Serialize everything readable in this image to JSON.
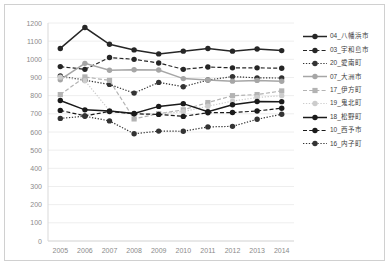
{
  "chart_data": {
    "type": "line",
    "title": "",
    "xlabel": "",
    "ylabel": "",
    "x": [
      2005,
      2006,
      2007,
      2008,
      2009,
      2010,
      2011,
      2012,
      2013,
      2014
    ],
    "xtick_labels": [
      "2005",
      "2006",
      "2007",
      "2008",
      "2009",
      "2010",
      "2011",
      "2012",
      "2013",
      "2014"
    ],
    "ytick_labels": [
      "1200",
      "1100",
      "1000",
      "900",
      "800",
      "700",
      "600",
      "500",
      "400",
      "300",
      "200",
      "100",
      "0"
    ],
    "ylim": [
      0,
      1200
    ],
    "ytick_step": 100,
    "grid": true,
    "legend_position": "right",
    "series": [
      {
        "name": "04_八幡浜市",
        "color": "#262626",
        "dash": "solid",
        "marker": "circle",
        "values": [
          1060,
          1175,
          1083,
          1052,
          1030,
          1045,
          1060,
          1045,
          1057,
          1048
        ]
      },
      {
        "name": "03_宇和島市",
        "color": "#262626",
        "dash": "dashed",
        "marker": "circle",
        "values": [
          960,
          945,
          1010,
          1000,
          980,
          945,
          958,
          953,
          953,
          951
        ]
      },
      {
        "name": "20_愛南町",
        "color": "#333333",
        "dash": "dotted",
        "marker": "circle",
        "values": [
          908,
          885,
          862,
          814,
          873,
          849,
          886,
          905,
          898,
          897
        ]
      },
      {
        "name": "07_大洲市",
        "color": "#a6a6a6",
        "dash": "solid",
        "marker": "circle",
        "values": [
          888,
          978,
          940,
          943,
          941,
          894,
          886,
          880,
          884,
          879
        ]
      },
      {
        "name": "17_伊方町",
        "color": "#b3b3b3",
        "dash": "dashed",
        "marker": "square",
        "values": [
          806,
          903,
          884,
          672,
          701,
          722,
          762,
          800,
          806,
          826
        ]
      },
      {
        "name": "19_鬼北町",
        "color": "#cccccc",
        "dash": "dotted",
        "marker": "circle",
        "values": [
          902,
          882,
          718,
          700,
          700,
          712,
          742,
          770,
          790,
          800
        ]
      },
      {
        "name": "18_松野町",
        "color": "#1a1a1a",
        "dash": "solid",
        "marker": "circle",
        "values": [
          773,
          722,
          715,
          702,
          741,
          756,
          712,
          750,
          768,
          767
        ]
      },
      {
        "name": "10_西予市",
        "color": "#1a1a1a",
        "dash": "dashed",
        "marker": "circle",
        "values": [
          719,
          689,
          713,
          700,
          697,
          686,
          706,
          707,
          716,
          731
        ]
      },
      {
        "name": "16_内子町",
        "color": "#333333",
        "dash": "dotted",
        "marker": "circle",
        "values": [
          675,
          687,
          661,
          590,
          605,
          604,
          628,
          631,
          670,
          698
        ]
      }
    ]
  },
  "legend": {
    "items": [
      {
        "label": "04_八幡浜市"
      },
      {
        "label": "03_宇和島市"
      },
      {
        "label": "20_愛南町"
      },
      {
        "label": "07_大洲市"
      },
      {
        "label": "17_伊方町"
      },
      {
        "label": "19_鬼北町"
      },
      {
        "label": "18_松野町"
      },
      {
        "label": "10_西予市"
      },
      {
        "label": "16_内子町"
      }
    ]
  }
}
